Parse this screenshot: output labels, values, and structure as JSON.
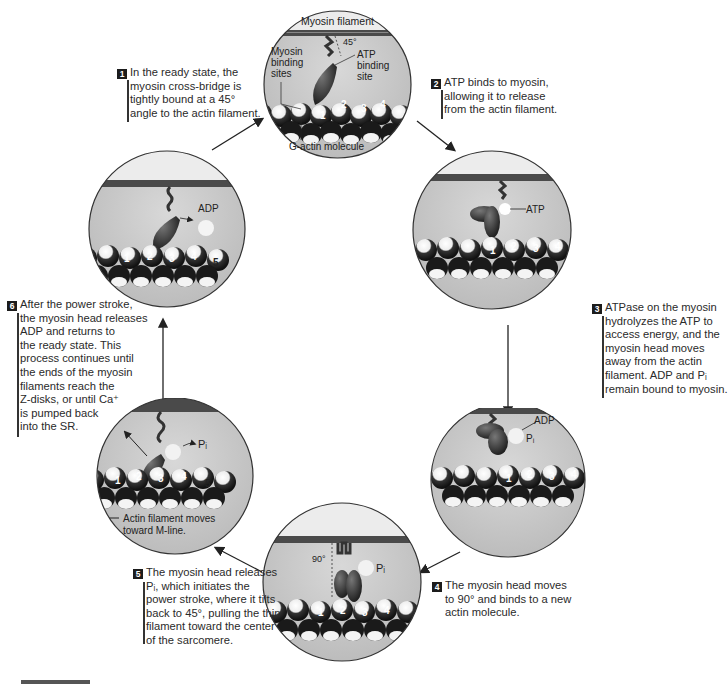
{
  "colors": {
    "circle_bg": "#c9c9c9",
    "filament": "#4a4a4a",
    "myosin_head": "#3a3a3a",
    "text": "#2a2a2a",
    "step_badge": "#1c1c1c"
  },
  "steps": [
    {
      "number": "1",
      "lines": [
        "In the ready state, the",
        "myosin cross-bridge is",
        "tightly bound at a 45°",
        "angle to the actin filament."
      ]
    },
    {
      "number": "2",
      "lines": [
        "ATP binds to myosin,",
        "allowing it to release",
        "from the actin filament."
      ]
    },
    {
      "number": "3",
      "lines": [
        "ATPase on the myosin",
        "hydrolyzes the ATP to",
        "access energy, and the",
        "myosin head moves",
        "away from the actin",
        "filament. ADP and Pᵢ",
        "remain bound to myosin."
      ]
    },
    {
      "number": "4",
      "lines": [
        "The myosin head moves",
        "to 90° and binds to a new",
        "actin molecule."
      ]
    },
    {
      "number": "5",
      "lines": [
        "The myosin head releases",
        "Pᵢ, which initiates the",
        "power stroke, where it tilts",
        "back to 45°, pulling the thin",
        "filament toward the center",
        "of the sarcomere."
      ]
    },
    {
      "number": "6",
      "lines": [
        "After the power stroke,",
        "the myosin head releases",
        "ADP and returns to",
        "the ready state. This",
        "process continues until",
        "the ends of the myosin",
        "filaments reach the",
        "Z-disks, or until Ca⁺",
        "is pumped back",
        "into the SR."
      ]
    }
  ],
  "panels": {
    "top": {
      "labels": {
        "myosin_filament": "Myosin filament",
        "angle": "45°",
        "myosin_binding_1": "Myosin",
        "myosin_binding_2": "binding",
        "myosin_binding_3": "sites",
        "atp_binding_1": "ATP",
        "atp_binding_2": "binding",
        "atp_binding_3": "site",
        "g_actin": "G-actin molecule"
      },
      "actin_numbers": [
        "1",
        "2",
        "3",
        "4"
      ]
    },
    "right_upper": {
      "labels": {
        "atp": "ATP"
      },
      "actin_numbers": [
        "1",
        "2",
        "3",
        "4"
      ]
    },
    "right_lower": {
      "labels": {
        "adp": "ADP",
        "pi": "Pᵢ"
      },
      "actin_numbers": [
        "1",
        "2",
        "3",
        "4"
      ]
    },
    "bottom": {
      "labels": {
        "angle": "90°",
        "pi": "Pᵢ"
      },
      "actin_numbers": [
        "1",
        "2",
        "3",
        "4"
      ]
    },
    "left_lower": {
      "labels": {
        "pi": "Pᵢ",
        "move_1": "Actin filament moves",
        "move_2": "toward M-line."
      },
      "actin_numbers": [
        "1",
        "2",
        "3",
        "4",
        "5"
      ]
    },
    "left_upper": {
      "labels": {
        "adp": "ADP"
      },
      "actin_numbers": [
        "1",
        "2",
        "3",
        "4",
        "5"
      ]
    }
  }
}
